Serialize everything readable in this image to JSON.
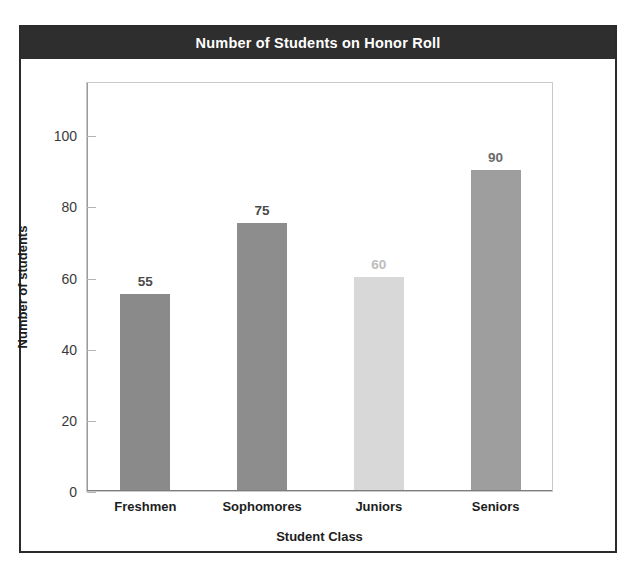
{
  "figure": {
    "title": "Number of Students on Honor Roll",
    "title_band_color": "#2e2e2e",
    "frame_color": "#2b2b2b",
    "background": "#ffffff"
  },
  "chart_data": {
    "type": "bar",
    "title": "Number of Students on Honor Roll",
    "xlabel": "Student Class",
    "ylabel": "Number of students",
    "categories": [
      "Freshmen",
      "Sophomores",
      "Juniors",
      "Seniors"
    ],
    "values": [
      55,
      75,
      60,
      90
    ],
    "value_labels": [
      "55",
      "75",
      "60",
      "90"
    ],
    "bar_colors": [
      "#8a8a8a",
      "#8d8d8d",
      "#d8d8d8",
      "#9e9e9e"
    ],
    "label_colors": [
      "#4a4a4a",
      "#4a4a4a",
      "#bdbdbd",
      "#6b6b6b"
    ],
    "ylim": [
      0,
      115
    ],
    "yticks": [
      0,
      20,
      40,
      60,
      80,
      100
    ],
    "ytick_labels": [
      "0",
      "20",
      "40",
      "60",
      "80",
      "100"
    ],
    "grid": false,
    "legend": "none"
  }
}
